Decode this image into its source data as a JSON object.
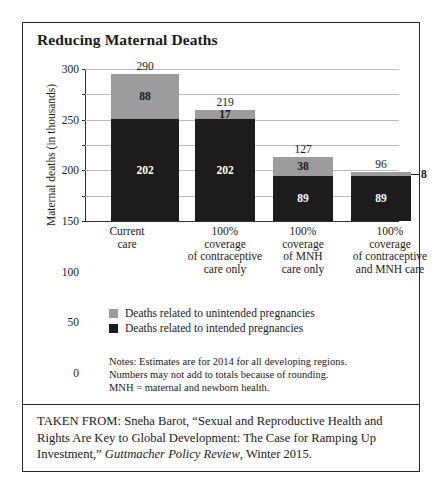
{
  "figure": {
    "title": "Reducing Maternal Deaths"
  },
  "chart_data": {
    "type": "bar",
    "subtype": "stacked",
    "title": "Reducing Maternal Deaths",
    "xlabel": "",
    "ylabel": "Maternal deaths (in thousands)",
    "ylim": [
      0,
      300
    ],
    "yticks": [
      0,
      50,
      100,
      150,
      200,
      250,
      300
    ],
    "grid": true,
    "legend_position": "below-plot-left",
    "categories": [
      "Current care",
      "100% coverage of contraceptive care only",
      "100% coverage of MNH care only",
      "100% coverage of contraceptive and MNH care"
    ],
    "category_label_lines": [
      [
        "Current",
        "care"
      ],
      [
        "100%",
        "coverage",
        "of contraceptive",
        "care only"
      ],
      [
        "100%",
        "coverage",
        "of MNH",
        "care only"
      ],
      [
        "100%",
        "coverage",
        "of contraceptive",
        "and MNH care"
      ]
    ],
    "series": [
      {
        "name": "Deaths related to intended pregnancies",
        "color": "#1c1c1c",
        "values": [
          202,
          202,
          89,
          89
        ]
      },
      {
        "name": "Deaths related to unintended pregnancies",
        "color": "#9c9c9c",
        "values": [
          88,
          17,
          38,
          8
        ]
      }
    ],
    "totals": [
      290,
      219,
      127,
      96
    ],
    "value_labels": {
      "intended": [
        "202",
        "202",
        "89",
        "89"
      ],
      "unintended": [
        "88",
        "17",
        "38",
        "8"
      ],
      "totals": [
        "290",
        "219",
        "127",
        "96"
      ]
    },
    "unintended_label_placement": [
      "inside",
      "inside",
      "inside",
      "outside-right"
    ]
  },
  "legend": [
    {
      "label": "Deaths related to unintended pregnancies",
      "swatch": "gray"
    },
    {
      "label": "Deaths related to intended pregnancies",
      "swatch": "dark"
    }
  ],
  "notes": [
    "Notes: Estimates are for 2014 for all developing regions.",
    "Numbers may not add to totals because of rounding.",
    "MNH = maternal and newborn health."
  ],
  "source": {
    "prefix": "TAKEN FROM: Sneha Barot, “Sexual and Reproductive Health and Rights Are Key to Global Development: The Case for Ramping Up Investment,” ",
    "publication": "Guttmacher Policy Review",
    "suffix": ", Winter 2015."
  },
  "colors": {
    "intended": "#1c1c1c",
    "unintended": "#9c9c9c",
    "frame": "#2a2a2a",
    "gridline": "#b9b9b9"
  }
}
